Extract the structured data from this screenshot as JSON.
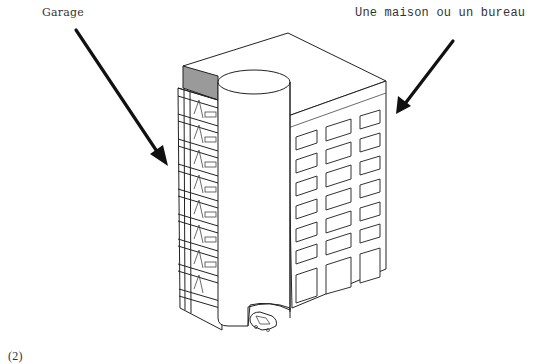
{
  "labels": {
    "garage": "Garage",
    "office": "Une maison ou un bureau",
    "figure_number": "(2)"
  },
  "illustration": {
    "subject": "building with garage levels, cylindrical ramp, and office/house block",
    "parts": [
      "garage-section",
      "cylindrical-ramp-tower",
      "office-block",
      "car"
    ],
    "office_window_grid": {
      "columns": 3,
      "rows": 8
    },
    "garage_levels": 8,
    "arrows": [
      {
        "name": "garage-arrow",
        "from": [
          55,
          40
        ],
        "to": [
          165,
          162
        ]
      },
      {
        "name": "office-arrow",
        "from": [
          455,
          42
        ],
        "to": [
          400,
          110
        ]
      }
    ],
    "colors": {
      "line": "#222222",
      "shade": "#9a9a9a",
      "background": "#ffffff"
    }
  }
}
